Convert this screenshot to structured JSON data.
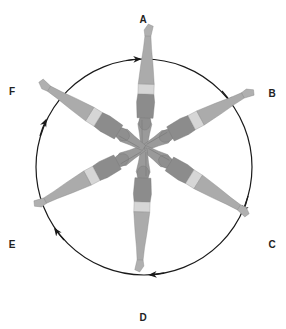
{
  "diagram": {
    "type": "rotation-cycle",
    "direction": "clockwise",
    "colors": {
      "circle": "#1a1a1a",
      "skin": "#a8a8a8",
      "skin_dark": "#8c8c8c",
      "trunks": "#d6d6d6",
      "label": "#222222"
    },
    "positions": [
      {
        "label": "A",
        "angle": 0
      },
      {
        "label": "B",
        "angle": 60
      },
      {
        "label": "C",
        "angle": 120
      },
      {
        "label": "D",
        "angle": 180
      },
      {
        "label": "E",
        "angle": 240
      },
      {
        "label": "F",
        "angle": 300
      }
    ]
  }
}
